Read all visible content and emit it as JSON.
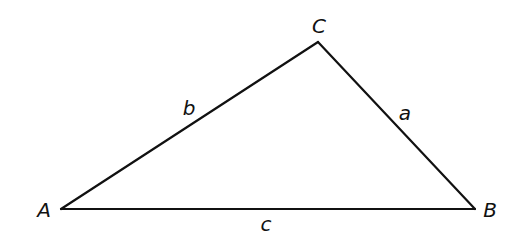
{
  "diagram": {
    "type": "triangle",
    "stroke_color": "#111111",
    "background": "#ffffff",
    "vertices": {
      "A": {
        "label": "A",
        "x": 61,
        "y": 209,
        "label_x": 44,
        "label_y": 217
      },
      "B": {
        "label": "B",
        "x": 475,
        "y": 209,
        "label_x": 490,
        "label_y": 217
      },
      "C": {
        "label": "C",
        "x": 318,
        "y": 42,
        "label_x": 319,
        "label_y": 33
      }
    },
    "sides": {
      "a": {
        "label": "a",
        "from": "B",
        "to": "C",
        "label_x": 405,
        "label_y": 120
      },
      "b": {
        "label": "b",
        "from": "A",
        "to": "C",
        "label_x": 189,
        "label_y": 115
      },
      "c": {
        "label": "c",
        "from": "A",
        "to": "B",
        "label_x": 266,
        "label_y": 231
      }
    }
  }
}
